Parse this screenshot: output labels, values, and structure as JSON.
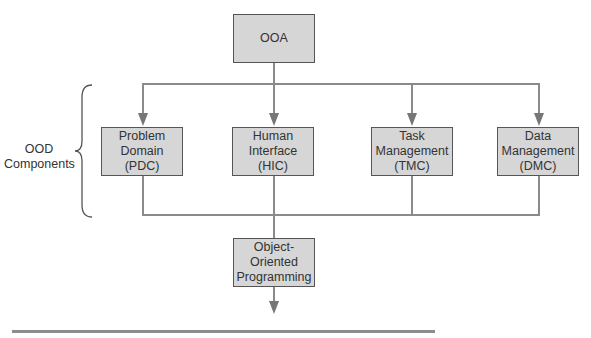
{
  "diagram": {
    "top_box": {
      "label": "OOA"
    },
    "group_label": "OOD\nComponents",
    "components": [
      {
        "label": "Problem\nDomain\n(PDC)"
      },
      {
        "label": "Human\nInterface\n(HIC)"
      },
      {
        "label": "Task\nManagement\n(TMC)"
      },
      {
        "label": "Data\nManagement\n(DMC)"
      }
    ],
    "bottom_box": {
      "label": "Object-\nOriented\nProgramming"
    }
  },
  "colors": {
    "box_fill": "#d6d6d6",
    "line": "#8a8a8a",
    "border": "#555555"
  }
}
